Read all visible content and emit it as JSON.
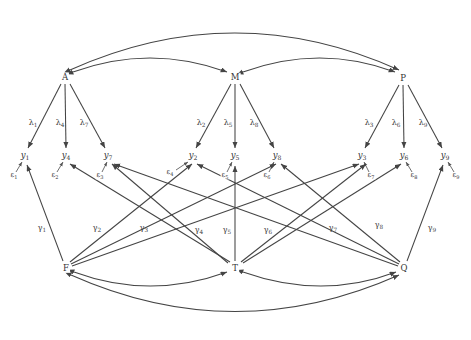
{
  "diagram": {
    "type": "structural-equation-path-diagram",
    "stroke_color": "#444444",
    "text_color": "#333333",
    "background": "#ffffff",
    "latent_factors": [
      {
        "id": "A",
        "label": "A",
        "x": 65,
        "y": 77
      },
      {
        "id": "M",
        "label": "M",
        "x": 235,
        "y": 77
      },
      {
        "id": "P",
        "label": "P",
        "x": 403,
        "y": 78
      }
    ],
    "predictors": [
      {
        "id": "F",
        "label": "F",
        "x": 66,
        "y": 268
      },
      {
        "id": "T",
        "label": "T",
        "x": 235,
        "y": 268
      },
      {
        "id": "Q",
        "label": "Q",
        "x": 404,
        "y": 268
      }
    ],
    "indicators": [
      {
        "id": "Y1",
        "base": "y",
        "sub": "1",
        "x": 25,
        "y": 156
      },
      {
        "id": "Y4",
        "base": "y",
        "sub": "4",
        "x": 66,
        "y": 156
      },
      {
        "id": "Y7",
        "base": "y",
        "sub": "7",
        "x": 108,
        "y": 156
      },
      {
        "id": "Y2",
        "base": "y",
        "sub": "2",
        "x": 193,
        "y": 156
      },
      {
        "id": "Y5",
        "base": "y",
        "sub": "5",
        "x": 235,
        "y": 156
      },
      {
        "id": "Y8",
        "base": "y",
        "sub": "8",
        "x": 277,
        "y": 156
      },
      {
        "id": "Y3",
        "base": "y",
        "sub": "3",
        "x": 362,
        "y": 156
      },
      {
        "id": "Y6",
        "base": "y",
        "sub": "6",
        "x": 404,
        "y": 156
      },
      {
        "id": "Y9",
        "base": "y",
        "sub": "9",
        "x": 445,
        "y": 156
      }
    ],
    "errors": [
      {
        "id": "E1",
        "base": "ε",
        "sub": "1",
        "x": 14,
        "y": 176,
        "target": "Y1"
      },
      {
        "id": "E2",
        "base": "ε",
        "sub": "2",
        "x": 55,
        "y": 176,
        "target": "Y4"
      },
      {
        "id": "E3",
        "base": "ε",
        "sub": "3",
        "x": 100,
        "y": 176,
        "target": "Y7"
      },
      {
        "id": "E4",
        "base": "ε",
        "sub": "4",
        "x": 170,
        "y": 173,
        "target": "Y2"
      },
      {
        "id": "E5",
        "base": "ε",
        "sub": "5",
        "x": 225,
        "y": 176,
        "target": "Y5"
      },
      {
        "id": "E6",
        "base": "ε",
        "sub": "6",
        "x": 267,
        "y": 176,
        "target": "Y8"
      },
      {
        "id": "E7",
        "base": "ε",
        "sub": "7",
        "x": 371,
        "y": 176,
        "target": "Y3"
      },
      {
        "id": "E8",
        "base": "ε",
        "sub": "8",
        "x": 414,
        "y": 176,
        "target": "Y6"
      },
      {
        "id": "E9",
        "base": "ε",
        "sub": "9",
        "x": 456,
        "y": 176,
        "target": "Y9"
      }
    ],
    "loadings": [
      {
        "id": "L1",
        "base": "λ",
        "sub": "1",
        "x": 33,
        "y": 124,
        "from": "A",
        "to": "Y1"
      },
      {
        "id": "L4",
        "base": "λ",
        "sub": "4",
        "x": 60,
        "y": 124,
        "from": "A",
        "to": "Y4"
      },
      {
        "id": "L7",
        "base": "λ",
        "sub": "7",
        "x": 84,
        "y": 124,
        "from": "A",
        "to": "Y7"
      },
      {
        "id": "L2",
        "base": "λ",
        "sub": "2",
        "x": 201,
        "y": 124,
        "from": "M",
        "to": "Y2"
      },
      {
        "id": "L5",
        "base": "λ",
        "sub": "5",
        "x": 228,
        "y": 124,
        "from": "M",
        "to": "Y5"
      },
      {
        "id": "L8",
        "base": "λ",
        "sub": "8",
        "x": 254,
        "y": 124,
        "from": "M",
        "to": "Y8"
      },
      {
        "id": "L3",
        "base": "λ",
        "sub": "3",
        "x": 369,
        "y": 124,
        "from": "P",
        "to": "Y3"
      },
      {
        "id": "L6",
        "base": "λ",
        "sub": "6",
        "x": 396,
        "y": 124,
        "from": "P",
        "to": "Y6"
      },
      {
        "id": "L9",
        "base": "λ",
        "sub": "9",
        "x": 423,
        "y": 124,
        "from": "P",
        "to": "Y9"
      }
    ],
    "regressions": [
      {
        "id": "G1",
        "base": "γ",
        "sub": "1",
        "x": 42,
        "y": 229,
        "from": "F",
        "to": "Y1"
      },
      {
        "id": "G2",
        "base": "γ",
        "sub": "2",
        "x": 97,
        "y": 229,
        "from": "F",
        "to": "Y4"
      },
      {
        "id": "G3",
        "base": "γ",
        "sub": "3",
        "x": 144,
        "y": 229,
        "from": "F",
        "to": "Y7"
      },
      {
        "id": "G4",
        "base": "γ",
        "sub": "4",
        "x": 199,
        "y": 231,
        "from": "T",
        "to": "Y2"
      },
      {
        "id": "G5",
        "base": "γ",
        "sub": "5",
        "x": 227,
        "y": 231,
        "from": "T",
        "to": "Y5"
      },
      {
        "id": "G6",
        "base": "γ",
        "sub": "6",
        "x": 268,
        "y": 231,
        "from": "T",
        "to": "Y8"
      },
      {
        "id": "G7",
        "base": "γ",
        "sub": "7",
        "x": 333,
        "y": 229,
        "from": "Q",
        "to": "Y3"
      },
      {
        "id": "G8",
        "base": "γ",
        "sub": "8",
        "x": 379,
        "y": 226,
        "from": "Q",
        "to": "Y6"
      },
      {
        "id": "G9",
        "base": "γ",
        "sub": "9",
        "x": 432,
        "y": 229,
        "from": "Q",
        "to": "Y9"
      }
    ],
    "covariances_top": [
      {
        "id": "COV_AM",
        "from": "A",
        "to": "M"
      },
      {
        "id": "COV_MP",
        "from": "M",
        "to": "P"
      },
      {
        "id": "COV_AP",
        "from": "A",
        "to": "P"
      }
    ],
    "covariances_bottom": [
      {
        "id": "COV_FT",
        "from": "F",
        "to": "T"
      },
      {
        "id": "COV_TQ",
        "from": "T",
        "to": "Q"
      },
      {
        "id": "COV_FQ",
        "from": "F",
        "to": "Q"
      }
    ],
    "cross_paths": [
      {
        "from": "F",
        "to": "Y1"
      },
      {
        "from": "F",
        "to": "Y4"
      },
      {
        "from": "F",
        "to": "Y7"
      },
      {
        "from": "F",
        "to": "Y2"
      },
      {
        "from": "F",
        "to": "Y8"
      },
      {
        "from": "F",
        "to": "Y3"
      },
      {
        "from": "T",
        "to": "Y5"
      },
      {
        "from": "T",
        "to": "Y2"
      },
      {
        "from": "T",
        "to": "Y8"
      },
      {
        "from": "T",
        "to": "Y4"
      },
      {
        "from": "T",
        "to": "Y6"
      },
      {
        "from": "Q",
        "to": "Y9"
      },
      {
        "from": "Q",
        "to": "Y3"
      },
      {
        "from": "Q",
        "to": "Y6"
      },
      {
        "from": "Q",
        "to": "Y7"
      },
      {
        "from": "Q",
        "to": "Y8"
      }
    ]
  }
}
